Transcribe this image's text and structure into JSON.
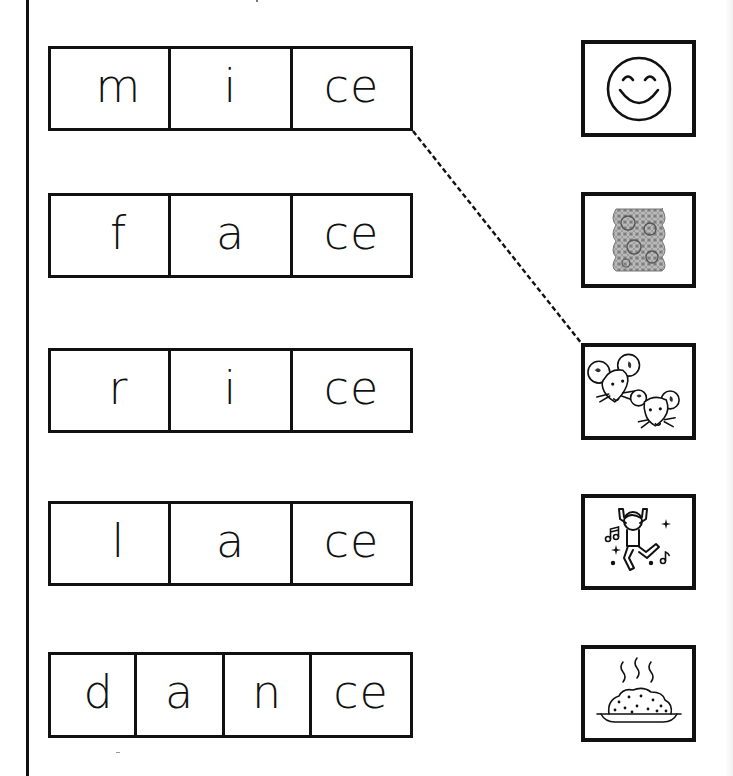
{
  "worksheet": {
    "activity": "match word to picture",
    "words": [
      {
        "id": "mice",
        "segments": [
          "m",
          "i",
          "ce"
        ]
      },
      {
        "id": "face",
        "segments": [
          "f",
          "a",
          "ce"
        ]
      },
      {
        "id": "rice",
        "segments": [
          "r",
          "i",
          "ce"
        ]
      },
      {
        "id": "lace",
        "segments": [
          "l",
          "a",
          "ce"
        ]
      },
      {
        "id": "dance",
        "segments": [
          "d",
          "a",
          "n",
          "ce"
        ]
      }
    ],
    "pictures": [
      {
        "id": "smiley-face",
        "icon": "smiley-face-icon"
      },
      {
        "id": "lace",
        "icon": "lace-icon"
      },
      {
        "id": "mice",
        "icon": "two-mice-icon"
      },
      {
        "id": "dance",
        "icon": "dancing-person-icon"
      },
      {
        "id": "rice",
        "icon": "steaming-rice-plate-icon"
      }
    ],
    "connections": [
      {
        "word": "mice",
        "picture": "mice",
        "style": "dashed"
      }
    ],
    "colors": {
      "ink": "#111111",
      "paper": "#ffffff"
    }
  }
}
